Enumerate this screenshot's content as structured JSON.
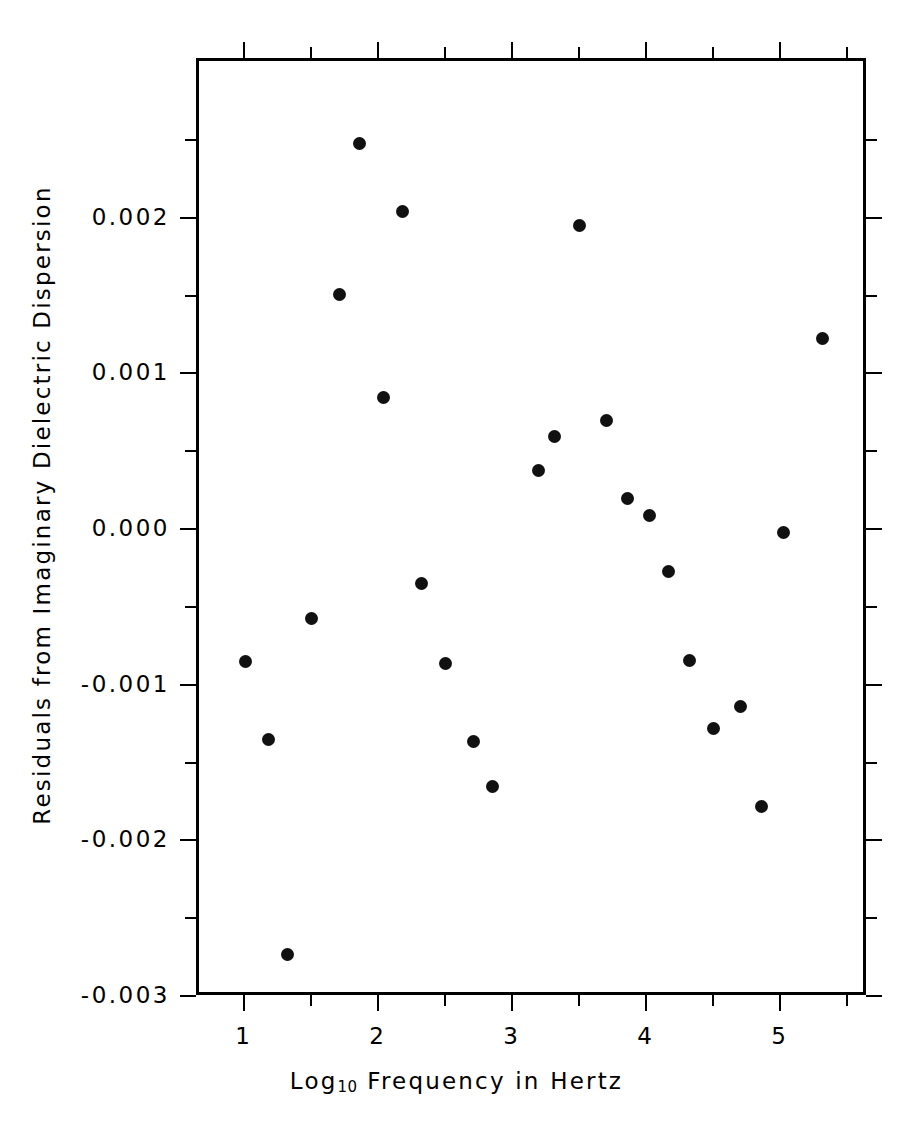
{
  "chart_data": {
    "type": "scatter",
    "title": "",
    "xlabel": "Log10 Frequency in Hertz",
    "xlabel_base": "Log",
    "xlabel_sub": "10",
    "xlabel_rest": " Frequency in Hertz",
    "ylabel": "Residuals from Imaginary Dielectric Dispersion",
    "xlim": [
      0.65,
      5.65
    ],
    "ylim": [
      -0.003,
      0.00302
    ],
    "grid": false,
    "legend": "none",
    "marker": "filled-circle",
    "marker_color": "#111111",
    "x_ticks_major": [
      1,
      2,
      3,
      4,
      5
    ],
    "x_tick_labels": [
      "1",
      "2",
      "3",
      "4",
      "5"
    ],
    "x_ticks_minor": [
      1.5,
      2.5,
      3.5,
      4.5,
      5.5
    ],
    "y_ticks_major": [
      0.002,
      0.001,
      0.0,
      -0.001,
      -0.002,
      -0.003
    ],
    "y_tick_labels": [
      "0.002",
      "0.001",
      "0.000",
      "-0.001",
      "-0.002",
      "-0.003"
    ],
    "y_ticks_minor": [
      0.0025,
      0.0015,
      0.0005,
      -0.0005,
      -0.0015,
      -0.0025
    ],
    "points": [
      {
        "x": 1.0,
        "y": -0.00084
      },
      {
        "x": 1.17,
        "y": -0.00134
      },
      {
        "x": 1.31,
        "y": -0.00272
      },
      {
        "x": 1.49,
        "y": -0.00056
      },
      {
        "x": 1.7,
        "y": 0.00152
      },
      {
        "x": 1.85,
        "y": 0.00249
      },
      {
        "x": 2.03,
        "y": 0.00086
      },
      {
        "x": 2.17,
        "y": 0.00205
      },
      {
        "x": 2.31,
        "y": -0.00034
      },
      {
        "x": 2.49,
        "y": -0.00085
      },
      {
        "x": 2.7,
        "y": -0.00135
      },
      {
        "x": 2.84,
        "y": -0.00164
      },
      {
        "x": 3.18,
        "y": 0.00039
      },
      {
        "x": 3.3,
        "y": 0.00061
      },
      {
        "x": 3.49,
        "y": 0.00196
      },
      {
        "x": 3.69,
        "y": 0.00071
      },
      {
        "x": 3.85,
        "y": 0.00021
      },
      {
        "x": 4.01,
        "y": 0.0001
      },
      {
        "x": 4.15,
        "y": -0.00026
      },
      {
        "x": 4.31,
        "y": -0.00083
      },
      {
        "x": 4.49,
        "y": -0.00127
      },
      {
        "x": 4.69,
        "y": -0.00113
      },
      {
        "x": 4.85,
        "y": -0.00177
      },
      {
        "x": 5.01,
        "y": -1e-05
      },
      {
        "x": 5.3,
        "y": 0.00124
      }
    ]
  },
  "axes": {
    "frame_color": "#000000"
  }
}
